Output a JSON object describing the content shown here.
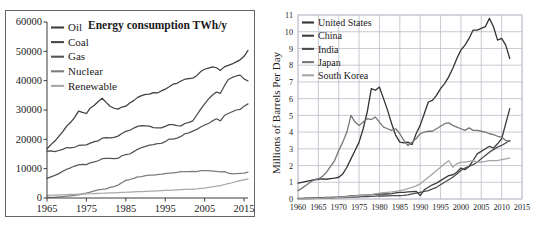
{
  "chart_data": [
    {
      "id": "energy-consumption",
      "type": "line",
      "title": "Energy consumption TWh/y",
      "xlabel": "",
      "ylabel": "",
      "xlim": [
        1965,
        2016
      ],
      "ylim": [
        0,
        60000
      ],
      "xticks": [
        1965,
        1975,
        1985,
        1995,
        2005,
        2015
      ],
      "yticks": [
        0,
        10000,
        20000,
        30000,
        40000,
        50000,
        60000
      ],
      "grid": false,
      "legend_position": "top-left",
      "colors": {
        "Oil": "#3f3f3f",
        "Coal": "#4a4a4a",
        "Gas": "#555555",
        "Nuclear": "#7d7d7d",
        "Renewable": "#a8a8a8"
      },
      "x": [
        1965,
        1966,
        1967,
        1968,
        1969,
        1970,
        1971,
        1972,
        1973,
        1974,
        1975,
        1976,
        1977,
        1978,
        1979,
        1980,
        1981,
        1982,
        1983,
        1984,
        1985,
        1986,
        1987,
        1988,
        1989,
        1990,
        1991,
        1992,
        1993,
        1994,
        1995,
        1996,
        1997,
        1998,
        1999,
        2000,
        2001,
        2002,
        2003,
        2004,
        2005,
        2006,
        2007,
        2008,
        2009,
        2010,
        2011,
        2012,
        2013,
        2014,
        2015,
        2016
      ],
      "series": [
        {
          "name": "Oil",
          "values": [
            16800,
            18200,
            19400,
            21000,
            22600,
            24500,
            25800,
            27400,
            29600,
            29200,
            28800,
            30700,
            31600,
            32900,
            34000,
            32600,
            31300,
            30600,
            30300,
            31000,
            31300,
            32400,
            33200,
            34300,
            34900,
            35300,
            35400,
            35900,
            35800,
            36500,
            37100,
            37900,
            38800,
            39100,
            39900,
            40500,
            40700,
            40900,
            41700,
            43100,
            43900,
            44300,
            44700,
            44400,
            43500,
            44700,
            45200,
            45700,
            46400,
            47100,
            48300,
            50300
          ]
        },
        {
          "name": "Coal",
          "values": [
            16000,
            16100,
            15800,
            16200,
            16600,
            17200,
            17100,
            17300,
            17900,
            18000,
            18100,
            18700,
            19200,
            19500,
            20400,
            20600,
            20500,
            20700,
            21100,
            22000,
            22700,
            23100,
            23800,
            24400,
            24700,
            24600,
            24500,
            24000,
            23900,
            23900,
            24400,
            25000,
            25000,
            24700,
            24600,
            25400,
            25800,
            26300,
            28300,
            30300,
            32100,
            33800,
            35100,
            36100,
            35700,
            38200,
            40400,
            41100,
            41600,
            41900,
            40600,
            39900
          ]
        },
        {
          "name": "Gas",
          "values": [
            6700,
            7200,
            7700,
            8300,
            9100,
            9800,
            10300,
            10900,
            11300,
            11500,
            11400,
            12000,
            12300,
            12700,
            13400,
            13500,
            13500,
            13400,
            13500,
            14400,
            14800,
            15000,
            15800,
            16600,
            17200,
            17600,
            18000,
            18200,
            18500,
            18600,
            19200,
            20100,
            20100,
            20400,
            21000,
            21900,
            22200,
            22800,
            23400,
            24200,
            24900,
            25400,
            26300,
            27000,
            26300,
            28100,
            28800,
            29400,
            30000,
            30200,
            31300,
            32100
          ]
        },
        {
          "name": "Nuclear",
          "values": [
            200,
            250,
            300,
            400,
            500,
            600,
            750,
            900,
            1100,
            1400,
            1700,
            2000,
            2400,
            2800,
            2900,
            3100,
            3600,
            3900,
            4400,
            5200,
            6000,
            6300,
            6700,
            7200,
            7300,
            7600,
            7800,
            7800,
            8000,
            8100,
            8300,
            8500,
            8600,
            8700,
            9000,
            9000,
            9000,
            9100,
            9000,
            9300,
            9300,
            9300,
            9200,
            9100,
            8900,
            9000,
            8500,
            8200,
            8300,
            8400,
            8500,
            8800
          ]
        },
        {
          "name": "Renewable",
          "values": [
            900,
            950,
            1000,
            1050,
            1100,
            1150,
            1200,
            1250,
            1300,
            1350,
            1400,
            1450,
            1500,
            1560,
            1620,
            1670,
            1720,
            1780,
            1840,
            1900,
            1960,
            2020,
            2080,
            2140,
            2200,
            2260,
            2320,
            2380,
            2440,
            2500,
            2560,
            2620,
            2690,
            2750,
            2820,
            2900,
            2950,
            3020,
            3100,
            3250,
            3400,
            3600,
            3800,
            4050,
            4250,
            4600,
            4900,
            5200,
            5600,
            5900,
            6200,
            6500
          ]
        }
      ]
    },
    {
      "id": "oil-consumption-by-country",
      "type": "line",
      "title": "",
      "xlabel": "",
      "ylabel": "Millions of Barrels Per Day",
      "xlim": [
        1960,
        2015
      ],
      "ylim": [
        0,
        11
      ],
      "xticks": [
        1960,
        1965,
        1970,
        1975,
        1980,
        1985,
        1990,
        1995,
        2000,
        2005,
        2010,
        2015
      ],
      "yticks": [
        0,
        1,
        2,
        3,
        4,
        5,
        6,
        7,
        8,
        9,
        10,
        11
      ],
      "grid": true,
      "legend_position": "top-left",
      "colors": {
        "United States": "#333333",
        "China": "#3d3d3d",
        "India": "#4d4d4d",
        "Japan": "#767676",
        "South Korea": "#a5a5a5"
      },
      "x": [
        1960,
        1961,
        1962,
        1963,
        1964,
        1965,
        1966,
        1967,
        1968,
        1969,
        1970,
        1971,
        1972,
        1973,
        1974,
        1975,
        1976,
        1977,
        1978,
        1979,
        1980,
        1981,
        1982,
        1983,
        1984,
        1985,
        1986,
        1987,
        1988,
        1989,
        1990,
        1991,
        1992,
        1993,
        1994,
        1995,
        1996,
        1997,
        1998,
        1999,
        2000,
        2001,
        2002,
        2003,
        2004,
        2005,
        2006,
        2007,
        2008,
        2009,
        2010,
        2011,
        2012
      ],
      "series": [
        {
          "name": "United States",
          "values": [
            0.95,
            1.0,
            1.05,
            1.1,
            1.15,
            1.18,
            1.2,
            1.18,
            1.22,
            1.25,
            1.3,
            1.5,
            1.9,
            2.4,
            2.9,
            3.4,
            4.2,
            5.2,
            6.6,
            6.5,
            6.7,
            6.0,
            5.3,
            4.5,
            3.8,
            3.4,
            3.35,
            3.4,
            3.25,
            3.9,
            4.4,
            5.1,
            5.8,
            5.9,
            6.2,
            6.6,
            6.9,
            7.3,
            7.8,
            8.4,
            8.9,
            9.2,
            9.6,
            10.1,
            10.1,
            10.2,
            10.3,
            10.8,
            10.3,
            9.5,
            9.6,
            9.2,
            8.4
          ]
        },
        {
          "name": "China",
          "values": [
            0.04,
            0.04,
            0.05,
            0.05,
            0.06,
            0.07,
            0.08,
            0.09,
            0.1,
            0.11,
            0.12,
            0.14,
            0.16,
            0.18,
            0.2,
            0.22,
            0.23,
            0.24,
            0.26,
            0.28,
            0.3,
            0.3,
            0.3,
            0.32,
            0.36,
            0.4,
            0.4,
            0.42,
            0.44,
            0.46,
            0.2,
            0.55,
            0.7,
            0.85,
            0.95,
            1.1,
            1.25,
            1.4,
            1.45,
            1.6,
            1.85,
            1.75,
            1.95,
            2.3,
            2.7,
            2.85,
            3.0,
            3.15,
            3.05,
            3.3,
            3.6,
            4.5,
            5.4
          ]
        },
        {
          "name": "India",
          "values": [
            0.02,
            0.02,
            0.03,
            0.03,
            0.04,
            0.04,
            0.05,
            0.05,
            0.06,
            0.07,
            0.08,
            0.09,
            0.1,
            0.11,
            0.12,
            0.13,
            0.14,
            0.15,
            0.16,
            0.17,
            0.18,
            0.18,
            0.19,
            0.2,
            0.2,
            0.2,
            0.22,
            0.25,
            0.3,
            0.35,
            0.4,
            0.45,
            0.5,
            0.6,
            0.7,
            0.85,
            1.0,
            1.15,
            1.3,
            1.5,
            1.7,
            1.85,
            1.95,
            2.05,
            2.2,
            2.4,
            2.6,
            2.8,
            2.95,
            3.1,
            3.2,
            3.35,
            3.5
          ]
        },
        {
          "name": "Japan",
          "values": [
            0.5,
            0.65,
            0.82,
            1.0,
            1.15,
            1.2,
            1.35,
            1.6,
            1.95,
            2.3,
            2.9,
            3.4,
            4.0,
            5.0,
            4.6,
            4.4,
            4.6,
            4.8,
            4.75,
            4.9,
            4.6,
            4.3,
            4.2,
            4.1,
            4.2,
            3.9,
            3.5,
            3.2,
            3.4,
            3.6,
            3.9,
            4.0,
            4.05,
            4.05,
            4.2,
            4.35,
            4.5,
            4.55,
            4.4,
            4.3,
            4.2,
            4.1,
            4.25,
            4.1,
            4.1,
            4.05,
            4.0,
            3.9,
            3.85,
            3.75,
            3.7,
            3.5,
            3.45
          ]
        },
        {
          "name": "South Korea",
          "values": [
            0.01,
            0.01,
            0.02,
            0.02,
            0.03,
            0.04,
            0.05,
            0.06,
            0.07,
            0.08,
            0.1,
            0.12,
            0.14,
            0.16,
            0.18,
            0.2,
            0.22,
            0.24,
            0.26,
            0.3,
            0.35,
            0.38,
            0.4,
            0.42,
            0.45,
            0.5,
            0.55,
            0.62,
            0.7,
            0.78,
            0.9,
            1.1,
            1.3,
            1.5,
            1.7,
            1.9,
            2.1,
            2.3,
            1.9,
            2.1,
            2.2,
            2.2,
            2.25,
            2.3,
            2.2,
            2.2,
            2.25,
            2.3,
            2.3,
            2.3,
            2.35,
            2.4,
            2.45
          ]
        }
      ]
    }
  ],
  "left_chart": {
    "title": "Energy consumption TWh/y",
    "legend": [
      {
        "label": "Oil"
      },
      {
        "label": "Coal"
      },
      {
        "label": "Gas"
      },
      {
        "label": "Nuclear"
      },
      {
        "label": "Renewable"
      }
    ],
    "yticklabels": [
      "60000",
      "50000",
      "40000",
      "30000",
      "20000",
      "10000",
      "0"
    ],
    "xticklabels": [
      "1965",
      "1975",
      "1985",
      "1995",
      "2005",
      "2015"
    ]
  },
  "right_chart": {
    "ylabel": "Millions of Barrels Per Day",
    "legend": [
      {
        "label": "United States"
      },
      {
        "label": "China"
      },
      {
        "label": "India"
      },
      {
        "label": "Japan"
      },
      {
        "label": "South Korea"
      }
    ],
    "yticklabels": [
      "11",
      "10",
      "9",
      "8",
      "7",
      "6",
      "5",
      "4",
      "3",
      "2",
      "1",
      "0"
    ],
    "xticklabels": [
      "1960",
      "1965",
      "1970",
      "1975",
      "1980",
      "1985",
      "1990",
      "1995",
      "2000",
      "2005",
      "2010",
      "2015"
    ]
  }
}
